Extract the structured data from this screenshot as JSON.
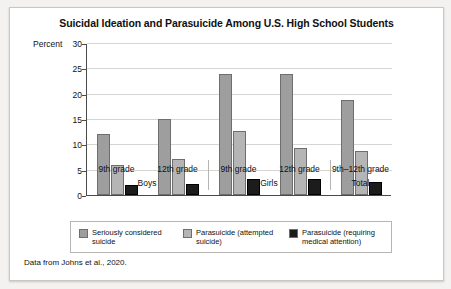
{
  "figure": {
    "title": "Suicidal Ideation and Parasuicide Among U.S. High School Students",
    "source_note": "Data from Johns et al., 2020.",
    "y_axis_label": "Percent"
  },
  "chart_data": {
    "type": "bar",
    "title": "Suicidal Ideation and Parasuicide Among U.S. High School Students",
    "xlabel": "",
    "ylabel": "Percent",
    "ylim": [
      0,
      30
    ],
    "yticks": [
      0,
      5,
      10,
      15,
      20,
      25,
      30
    ],
    "grid": true,
    "legend_position": "bottom",
    "categories": [
      "9th grade",
      "12th grade",
      "9th grade",
      "12th grade",
      "9th–12th grade"
    ],
    "group_labels": [
      "Boys",
      "Girls",
      "Total"
    ],
    "groups": [
      {
        "label": "Boys",
        "categories": [
          "9th grade",
          "12th grade"
        ]
      },
      {
        "label": "Girls",
        "categories": [
          "9th grade",
          "12th grade"
        ]
      },
      {
        "label": "Total",
        "categories": [
          "9th–12th grade"
        ]
      }
    ],
    "series": [
      {
        "name": "Seriously considered suicide",
        "color": "#9e9e9e",
        "values": [
          12.0,
          15.0,
          23.8,
          23.9,
          18.8
        ]
      },
      {
        "name": "Parasuicide (attempted suicide)",
        "color": "#b5b5b5",
        "values": [
          6.0,
          7.2,
          12.6,
          9.3,
          8.6
        ]
      },
      {
        "name": "Parasuicide (requiring medical attention)",
        "color": "#1c1c1c",
        "values": [
          1.9,
          2.2,
          3.2,
          3.1,
          2.5
        ]
      }
    ]
  },
  "legend": [
    {
      "label": "Seriously considered suicide",
      "color": "#9e9e9e"
    },
    {
      "label": "Parasuicide (attempted suicide)",
      "color": "#b5b5b5"
    },
    {
      "label": "Parasuicide (requiring medical attention)",
      "color": "#1c1c1c"
    }
  ]
}
